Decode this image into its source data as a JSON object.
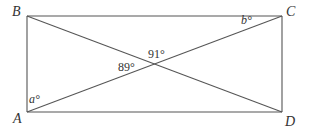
{
  "diagram": {
    "type": "rectangle-with-diagonals",
    "colors": {
      "stroke": "#555555",
      "text": "#333333",
      "background": "#ffffff"
    },
    "vertices": {
      "A": {
        "label": "A",
        "x": 27,
        "y": 112
      },
      "B": {
        "label": "B",
        "x": 27,
        "y": 16
      },
      "C": {
        "label": "C",
        "x": 282,
        "y": 16
      },
      "D": {
        "label": "D",
        "x": 282,
        "y": 112
      }
    },
    "edges": [
      [
        "A",
        "B"
      ],
      [
        "B",
        "C"
      ],
      [
        "C",
        "D"
      ],
      [
        "D",
        "A"
      ]
    ],
    "diagonals": [
      [
        "A",
        "C"
      ],
      [
        "B",
        "D"
      ]
    ],
    "angles": {
      "a": {
        "var": "a",
        "text": "a°",
        "at": "A",
        "between": [
          "AB",
          "AC"
        ]
      },
      "b": {
        "var": "b",
        "text": "b°",
        "at": "C",
        "between": [
          "CB",
          "CA"
        ]
      },
      "top": {
        "text": "91°",
        "at": "intersection",
        "position": "upper"
      },
      "left": {
        "text": "89°",
        "at": "intersection",
        "position": "left"
      }
    }
  }
}
